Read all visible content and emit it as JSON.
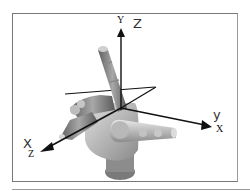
{
  "figure": {
    "axes": {
      "y": {
        "label": "Y",
        "handwritten": "Z"
      },
      "x": {
        "label": "X",
        "handwritten": "y"
      },
      "z": {
        "label": "Z",
        "handwritten": "X"
      }
    }
  },
  "colors": {
    "frame": "#777777",
    "axis": "#111111",
    "hand_dark": "#6e6e6e",
    "hand_mid": "#9c9c9c",
    "hand_light": "#d0d0d0"
  }
}
